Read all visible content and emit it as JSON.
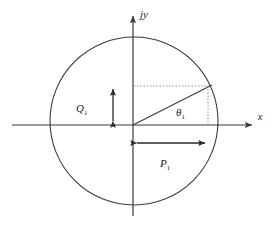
{
  "figure": {
    "type": "phasor-power-circle-diagram",
    "background_color": "#ffffff",
    "line_color": "#3a3a3a",
    "dotted_color": "#777777",
    "text_color": "#1a1a1a"
  },
  "axes": {
    "y_axis_label": "jy",
    "x_axis_label": "x",
    "origin": {
      "x": 133,
      "y": 125
    },
    "x_axis_start_x": 12,
    "x_axis_end_x": 258,
    "y_axis_top_y": 12,
    "y_axis_bottom_y": 216
  },
  "circle": {
    "center_x": 134,
    "center_y": 121,
    "radius": 84,
    "filled": false
  },
  "phasor": {
    "tip_x": 211,
    "tip_y": 86,
    "angle_label": "θ",
    "angle_subscript": "1"
  },
  "measurements": [
    {
      "name": "reactive-power",
      "label": "Q",
      "subscript": "1",
      "orientation": "vertical",
      "arrow_x": 113,
      "arrow_top_y": 85,
      "arrow_bottom_y": 125,
      "label_x": 82,
      "label_y": 109
    },
    {
      "name": "real-power",
      "label": "P",
      "subscript": "1",
      "orientation": "horizontal",
      "arrow_y": 143,
      "arrow_left_x": 134,
      "arrow_right_x": 208,
      "label_x": 165,
      "label_y": 164
    }
  ],
  "projection_lines": [
    {
      "name": "horizontal-projection",
      "from_x": 134,
      "from_y": 86,
      "to_x": 208,
      "to_y": 86,
      "style": "dotted"
    },
    {
      "name": "vertical-projection",
      "from_x": 208,
      "from_y": 86,
      "to_x": 208,
      "to_y": 125,
      "style": "dotted"
    }
  ],
  "labels": {
    "jy": "jy",
    "x": "x",
    "theta": "θ",
    "theta_sub": "1",
    "Q": "Q",
    "Q_sub": "1",
    "P": "P",
    "P_sub": "1"
  }
}
